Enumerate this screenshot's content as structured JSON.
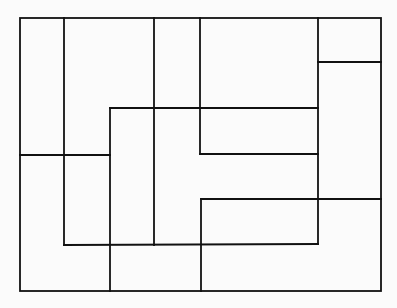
{
  "diagram": {
    "stroke_color": "#111111",
    "background": "#fbfbfb",
    "stroke_width": 1.8,
    "outer": {
      "x1": 20,
      "y1": 18,
      "x2": 381,
      "y2": 291
    },
    "segments": [
      {
        "id": "v-64",
        "x1": 64,
        "y1": 18,
        "x2": 64,
        "y2": 245
      },
      {
        "id": "v-154",
        "x1": 154,
        "y1": 18,
        "x2": 154,
        "y2": 245
      },
      {
        "id": "v-200-top",
        "x1": 200,
        "y1": 18,
        "x2": 200,
        "y2": 154
      },
      {
        "id": "v-318",
        "x1": 318,
        "y1": 18,
        "x2": 318,
        "y2": 244
      },
      {
        "id": "h-62",
        "x1": 318,
        "y1": 62,
        "x2": 381,
        "y2": 62
      },
      {
        "id": "h-108",
        "x1": 110,
        "y1": 108,
        "x2": 318,
        "y2": 108
      },
      {
        "id": "v-110",
        "x1": 110,
        "y1": 108,
        "x2": 110,
        "y2": 291
      },
      {
        "id": "h-154",
        "x1": 200,
        "y1": 154,
        "x2": 318,
        "y2": 154
      },
      {
        "id": "h-155-left",
        "x1": 20,
        "y1": 155,
        "x2": 110,
        "y2": 155
      },
      {
        "id": "h-199",
        "x1": 201,
        "y1": 199,
        "x2": 381,
        "y2": 199
      },
      {
        "id": "v-201-bottom",
        "x1": 201,
        "y1": 199,
        "x2": 201,
        "y2": 291
      },
      {
        "id": "h-245",
        "x1": 64,
        "y1": 245,
        "x2": 318,
        "y2": 244
      }
    ]
  }
}
